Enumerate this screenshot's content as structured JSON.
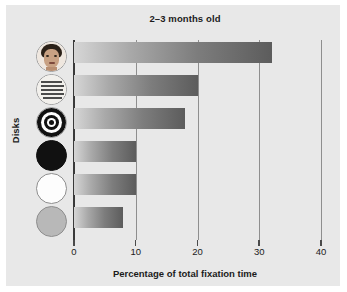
{
  "chart_data": {
    "type": "bar",
    "orientation": "horizontal",
    "title": "2–3 months old",
    "xlabel": "Percentage of total fixation time",
    "ylabel": "Disks",
    "categories": [
      "face",
      "newsprint",
      "bullseye",
      "black",
      "white",
      "yellow"
    ],
    "category_icons": [
      "face-disk-icon",
      "newsprint-disk-icon",
      "bullseye-disk-icon",
      "black-disk-icon",
      "white-disk-icon",
      "grey-disk-icon"
    ],
    "values": [
      32,
      20,
      18,
      10,
      10,
      8
    ],
    "xlim": [
      0,
      40
    ],
    "xticks": [
      0,
      10,
      20,
      30,
      40
    ],
    "xtick_labels": [
      "0",
      "10",
      "20",
      "30",
      "40"
    ],
    "grid": "vertical",
    "legend": "none",
    "bar_gradient_from": "#d6d6d6",
    "bar_gradient_to": "#5c5c5c",
    "panel_color": "#e8e8e8",
    "axis_color": "#3a3a3a",
    "gridline_color": "#8e8e8e"
  }
}
